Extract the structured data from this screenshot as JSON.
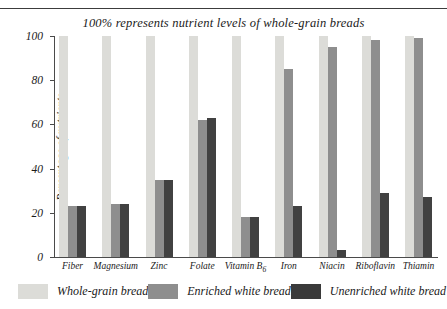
{
  "figure": {
    "title": "100% represents nutrient levels of whole-grain breads"
  },
  "chart_data": {
    "type": "bar",
    "title": "100% represents nutrient levels of whole-grain breads",
    "xlabel": "",
    "ylabel": "Percentage of nutrients",
    "ylim": [
      0,
      100
    ],
    "yticks": [
      "0",
      "20",
      "40",
      "60",
      "80",
      "100"
    ],
    "grid": false,
    "legend_position": "bottom",
    "categories": [
      "Fiber",
      "Magnesium",
      "Zinc",
      "Folate",
      "Vitamin B6",
      "Iron",
      "Niacin",
      "Riboflavin",
      "Thiamin"
    ],
    "category_labels": [
      "Fiber",
      "Magnesium",
      "Zinc",
      "Folate",
      "Vitamin B",
      "Iron",
      "Niacin",
      "Riboflavin",
      "Thiamin"
    ],
    "series": [
      {
        "name": "Whole-grain bread",
        "color": "#dcdcd8",
        "values": [
          100,
          100,
          100,
          100,
          100,
          100,
          100,
          100,
          100
        ]
      },
      {
        "name": "Enriched white bread",
        "color": "#8e8e8e",
        "values": [
          23,
          24,
          35,
          62,
          18,
          85,
          95,
          98,
          99
        ]
      },
      {
        "name": "Unenriched white bread",
        "color": "#3a3a3a",
        "values": [
          23,
          24,
          35,
          63,
          18,
          23,
          3,
          29,
          27
        ]
      }
    ]
  },
  "legend": {
    "items": [
      {
        "label": "Whole-grain bread"
      },
      {
        "label": "Enriched white bread"
      },
      {
        "label": "Unenriched white bread"
      }
    ]
  }
}
